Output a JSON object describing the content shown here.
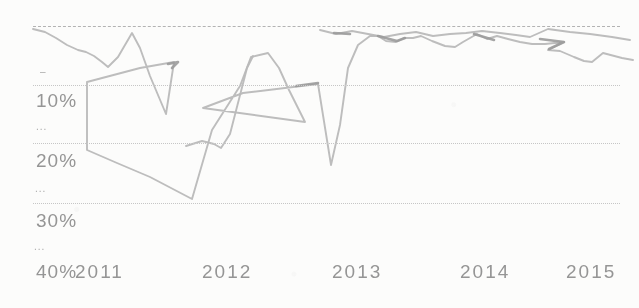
{
  "page": {
    "background": "#fcfcfb",
    "description_text": ""
  },
  "chart_data": {
    "type": "line",
    "title": "",
    "legend": [],
    "grid": "horizontal dotted gridlines",
    "line_color": "#b9b9b9",
    "knot_color": "#9b9b9b",
    "grid_color": "#c6c6c6",
    "text_color": "#8d8d8d",
    "x_axis": {
      "tick_labels": [
        "2011",
        "2012",
        "2013",
        "2014",
        "2015"
      ],
      "tick_x_px": [
        97,
        224,
        354,
        482,
        588
      ],
      "label_row_y_px": 262
    },
    "y_axis": {
      "tick_labels": [
        "10%",
        "20%",
        "30%",
        "40%"
      ],
      "tick_label_y_px": [
        91,
        151,
        211,
        262
      ],
      "label_x_px": 36,
      "inverted": true,
      "range_pct": [
        0,
        40
      ],
      "minor_marks": [
        {
          "text": "–",
          "x": 40,
          "y": 69
        },
        {
          "text": "...",
          "x": 36,
          "y": 124
        },
        {
          "text": "...",
          "x": 35,
          "y": 186
        },
        {
          "text": "...",
          "x": 34,
          "y": 244
        }
      ]
    },
    "gridlines": [
      {
        "pct": 0,
        "y_px": 26,
        "style": "dashed"
      },
      {
        "pct": 10,
        "y_px": 85,
        "style": "dotted"
      },
      {
        "pct": 20,
        "y_px": 143,
        "style": "dotted"
      },
      {
        "pct": 30,
        "y_px": 203,
        "style": "dotted"
      }
    ],
    "plot_x_px": [
      33,
      620
    ],
    "px_to_value_mapping": {
      "x": "year = 2011 + (x_px - 97) / 128.5",
      "y": "pct = (y_px - 26) / 5.9  (0% at top, values increase downward)"
    },
    "strands": [
      {
        "name": "main-trend",
        "points_px": [
          [
            33,
            29
          ],
          [
            45,
            32
          ],
          [
            56,
            38
          ],
          [
            67,
            45
          ],
          [
            78,
            50
          ],
          [
            86,
            52
          ],
          [
            94,
            56
          ],
          [
            102,
            62
          ],
          [
            108,
            67
          ],
          [
            118,
            57
          ],
          [
            132,
            33
          ],
          [
            140,
            48
          ],
          [
            150,
            76
          ],
          [
            166,
            114
          ],
          [
            174,
            62
          ],
          [
            140,
            68
          ],
          [
            87,
            82
          ],
          [
            87,
            150
          ],
          [
            117,
            163
          ],
          [
            150,
            177
          ],
          [
            192,
            199
          ],
          [
            212,
            130
          ],
          [
            240,
            86
          ],
          [
            251,
            57
          ],
          [
            268,
            53
          ],
          [
            279,
            68
          ],
          [
            289,
            90
          ],
          [
            305,
            122
          ],
          [
            203,
            108
          ],
          [
            243,
            93
          ],
          [
            318,
            84
          ],
          [
            331,
            165
          ],
          [
            340,
            125
          ],
          [
            348,
            68
          ],
          [
            358,
            45
          ],
          [
            370,
            36
          ],
          [
            378,
            36
          ],
          [
            386,
            41
          ],
          [
            396,
            42
          ],
          [
            404,
            38
          ],
          [
            413,
            38
          ],
          [
            421,
            36
          ],
          [
            432,
            41
          ],
          [
            445,
            46
          ],
          [
            455,
            47
          ],
          [
            463,
            42
          ],
          [
            470,
            38
          ],
          [
            477,
            34
          ],
          [
            487,
            39
          ],
          [
            497,
            36
          ],
          [
            508,
            39
          ],
          [
            520,
            42
          ],
          [
            532,
            44
          ],
          [
            545,
            44
          ],
          [
            564,
            42
          ],
          [
            548,
            50
          ],
          [
            560,
            51
          ],
          [
            574,
            57
          ],
          [
            584,
            61
          ],
          [
            592,
            62
          ],
          [
            603,
            53
          ],
          [
            622,
            58
          ],
          [
            633,
            60
          ]
        ]
      },
      {
        "name": "plateau-to-peak",
        "points_px": [
          [
            186,
            146
          ],
          [
            202,
            141
          ],
          [
            214,
            144
          ],
          [
            221,
            148
          ],
          [
            230,
            134
          ],
          [
            247,
            68
          ],
          [
            253,
            56
          ]
        ]
      },
      {
        "name": "upper-right-strand",
        "points_px": [
          [
            320,
            30
          ],
          [
            336,
            34
          ],
          [
            352,
            31
          ],
          [
            368,
            34
          ],
          [
            384,
            37
          ],
          [
            400,
            34
          ],
          [
            416,
            32
          ],
          [
            433,
            36
          ],
          [
            450,
            34
          ],
          [
            466,
            33
          ],
          [
            482,
            31
          ],
          [
            500,
            33
          ],
          [
            516,
            35
          ],
          [
            530,
            37
          ],
          [
            548,
            29
          ],
          [
            570,
            32
          ],
          [
            590,
            34
          ],
          [
            612,
            37
          ],
          [
            630,
            40
          ]
        ]
      }
    ],
    "knots": [
      {
        "name": "knot-2011-apex",
        "points_px": [
          [
            168,
            64
          ],
          [
            178,
            62
          ],
          [
            172,
            68
          ]
        ]
      },
      {
        "name": "knot-pre-plunge",
        "points_px": [
          [
            296,
            86
          ],
          [
            318,
            83
          ]
        ]
      },
      {
        "name": "knot-2013-left",
        "points_px": [
          [
            334,
            33
          ],
          [
            350,
            34
          ]
        ]
      },
      {
        "name": "knot-2013-mid",
        "points_px": [
          [
            378,
            36
          ],
          [
            397,
            41
          ],
          [
            405,
            38
          ]
        ]
      },
      {
        "name": "knot-2014-left",
        "points_px": [
          [
            474,
            34
          ],
          [
            494,
            40
          ]
        ]
      },
      {
        "name": "knot-2014-right",
        "points_px": [
          [
            540,
            39
          ],
          [
            564,
            42
          ],
          [
            549,
            49
          ]
        ]
      }
    ]
  }
}
